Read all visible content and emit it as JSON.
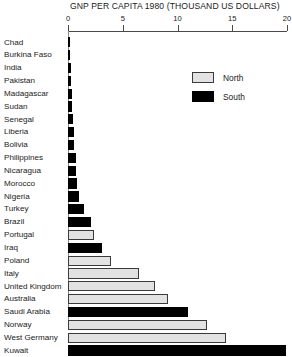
{
  "chart_data": {
    "type": "bar",
    "orientation": "horizontal",
    "title": "GNP PER CAPITA 1980 (THOUSAND US DOLLARS)",
    "xlabel": "",
    "ylabel": "",
    "xlim": [
      0,
      20
    ],
    "xticks": [
      0,
      5,
      10,
      15,
      20
    ],
    "xtick_labels": [
      "0",
      "5",
      "10",
      "15",
      "20"
    ],
    "grid": false,
    "legend_position": "upper-right",
    "categories": [
      "Chad",
      "Burkina Faso",
      "India",
      "Pakistan",
      "Madagascar",
      "Sudan",
      "Senegal",
      "Liberia",
      "Bolivia",
      "Philippines",
      "Nicaragua",
      "Morocco",
      "Nigeria",
      "Turkey",
      "Brazil",
      "Portugal",
      "Iraq",
      "Poland",
      "Italy",
      "United Kingdom",
      "Australia",
      "Saudi Arabia",
      "Norway",
      "West Germany",
      "Kuwait"
    ],
    "values": [
      0.12,
      0.18,
      0.24,
      0.3,
      0.35,
      0.41,
      0.45,
      0.52,
      0.57,
      0.69,
      0.74,
      0.86,
      1.0,
      1.47,
      2.12,
      2.39,
      3.08,
      3.9,
      6.48,
      7.92,
      9.1,
      11.0,
      12.7,
      14.4,
      19.9
    ],
    "groups": [
      "South",
      "South",
      "South",
      "South",
      "South",
      "South",
      "South",
      "South",
      "South",
      "South",
      "South",
      "South",
      "South",
      "South",
      "South",
      "North",
      "South",
      "North",
      "North",
      "North",
      "North",
      "South",
      "North",
      "North",
      "South"
    ],
    "series": [
      {
        "name": "North",
        "color": "#e2e2e2"
      },
      {
        "name": "South",
        "color": "#000000"
      }
    ]
  },
  "legend": {
    "items": [
      {
        "label": "North",
        "key": "north"
      },
      {
        "label": "South",
        "key": "south"
      }
    ]
  },
  "colors": {
    "north": "#e2e2e2",
    "south": "#000000",
    "axis": "#4a4a4a",
    "text": "#1a1a1a",
    "background": "#ffffff"
  }
}
